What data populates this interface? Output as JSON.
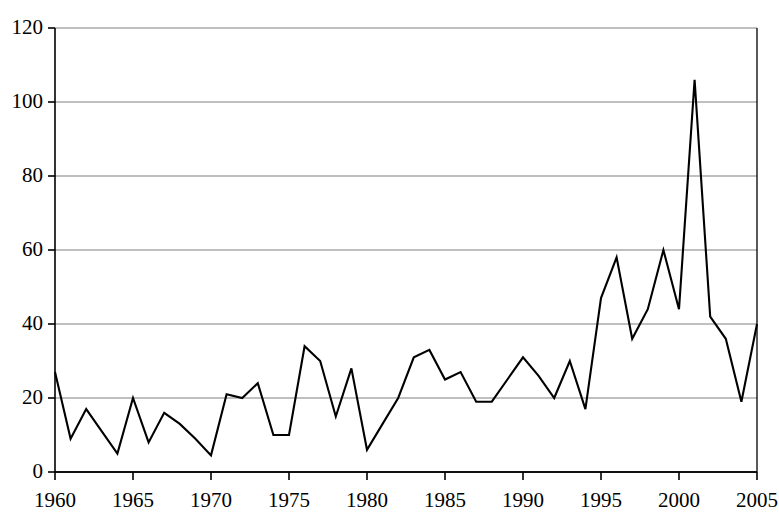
{
  "chart_data": {
    "type": "line",
    "title": "",
    "subtitle": "",
    "xlabel": "",
    "ylabel": "",
    "xlim": [
      1960,
      2005
    ],
    "ylim": [
      0,
      120
    ],
    "grid": true,
    "grid_axis": "y",
    "legend": false,
    "legend_position": "none",
    "line_color": "#000000",
    "gridline_color": "#808080",
    "axis_color": "#000000",
    "background": "#ffffff",
    "xtick_labels": [
      "1960",
      "1965",
      "1970",
      "1975",
      "1980",
      "1985",
      "1990",
      "1995",
      "2000",
      "2005"
    ],
    "xtick_values": [
      1960,
      1965,
      1970,
      1975,
      1980,
      1985,
      1990,
      1995,
      2000,
      2005
    ],
    "xtick_minor_step": 1,
    "ytick_labels": [
      "0",
      "20",
      "40",
      "60",
      "80",
      "100",
      "120"
    ],
    "ytick_values": [
      0,
      20,
      40,
      60,
      80,
      100,
      120
    ],
    "x": [
      1960,
      1961,
      1962,
      1963,
      1964,
      1965,
      1966,
      1967,
      1968,
      1969,
      1970,
      1971,
      1972,
      1973,
      1974,
      1975,
      1976,
      1977,
      1978,
      1979,
      1980,
      1981,
      1982,
      1983,
      1984,
      1985,
      1986,
      1987,
      1988,
      1989,
      1990,
      1991,
      1992,
      1993,
      1994,
      1995,
      1996,
      1997,
      1998,
      1999,
      2000,
      2001,
      2002,
      2003,
      2004,
      2005
    ],
    "values": [
      27,
      9,
      17,
      11,
      5,
      20,
      8,
      16,
      13,
      9,
      4.5,
      21,
      20,
      24,
      10,
      10,
      34,
      30,
      15,
      28,
      6,
      13,
      20,
      31,
      33,
      25,
      27,
      19,
      19,
      25,
      31,
      26,
      20,
      30,
      17,
      47,
      58,
      36,
      44,
      60,
      44,
      106,
      42,
      36,
      19,
      40
    ],
    "series": [
      {
        "name": "series-1",
        "values": [
          27,
          9,
          17,
          11,
          5,
          20,
          8,
          16,
          13,
          9,
          4.5,
          21,
          20,
          24,
          10,
          10,
          34,
          30,
          15,
          28,
          6,
          13,
          20,
          31,
          33,
          25,
          27,
          19,
          19,
          25,
          31,
          26,
          20,
          30,
          17,
          47,
          58,
          36,
          44,
          60,
          44,
          106,
          42,
          36,
          19,
          40
        ]
      }
    ],
    "annotations": []
  },
  "plot_geometry": {
    "left": 55,
    "right": 757,
    "top": 28,
    "bottom": 472
  }
}
